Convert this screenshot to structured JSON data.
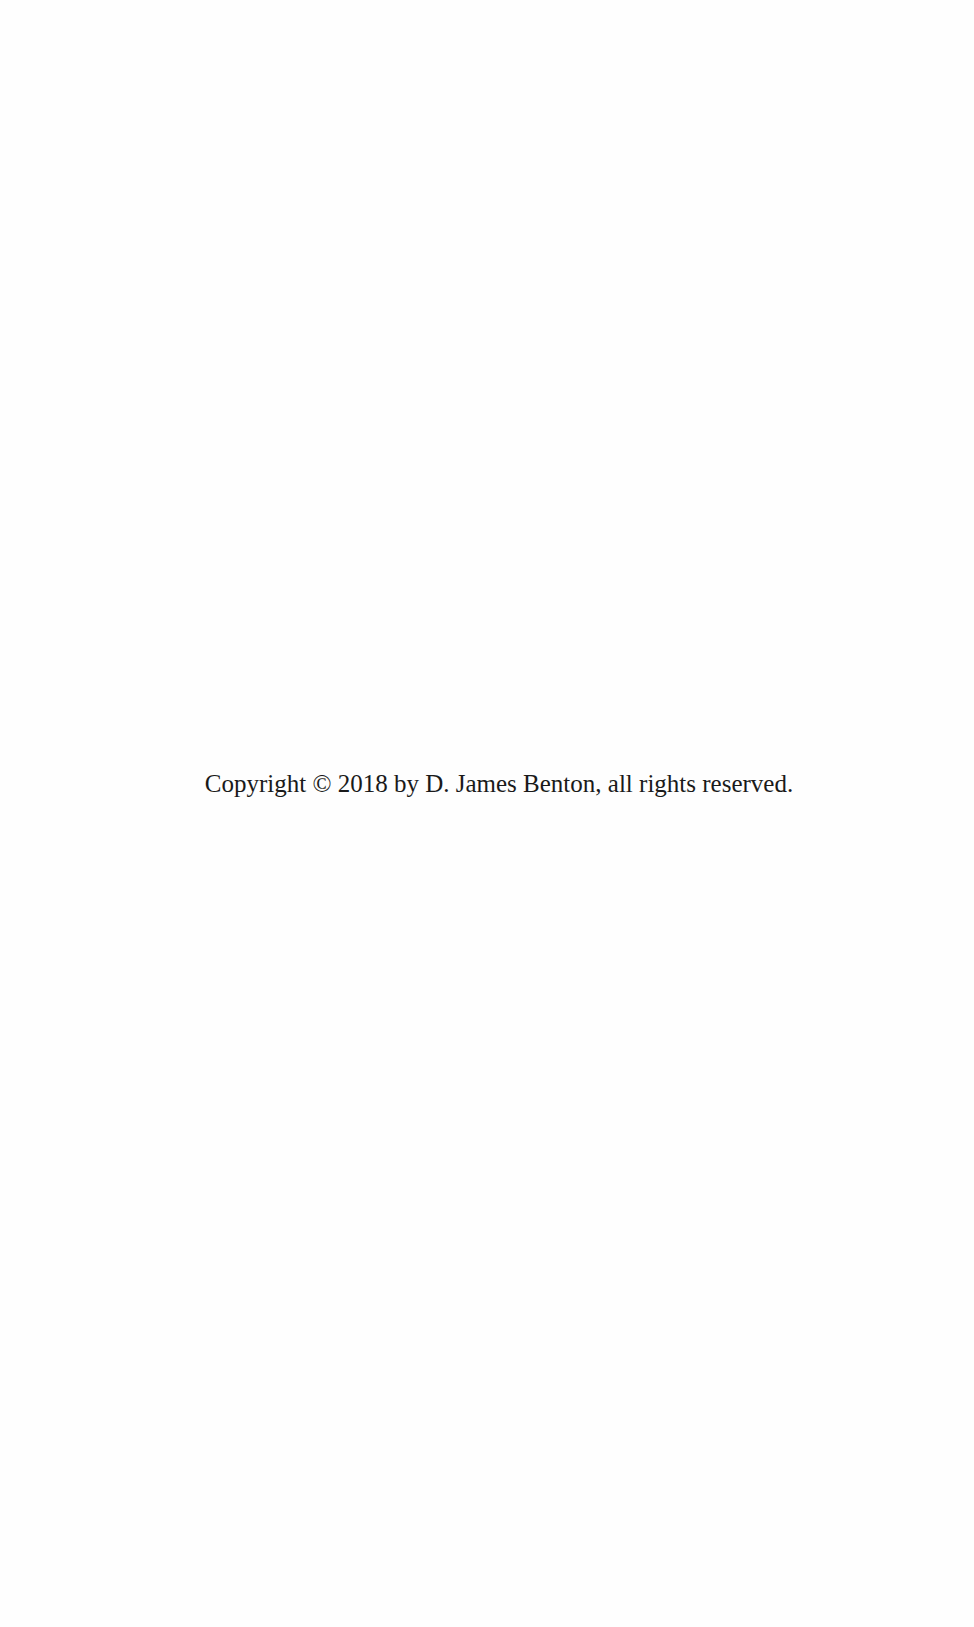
{
  "page": {
    "copyright_text": "Copyright © 2018 by D. James Benton, all rights reserved."
  }
}
